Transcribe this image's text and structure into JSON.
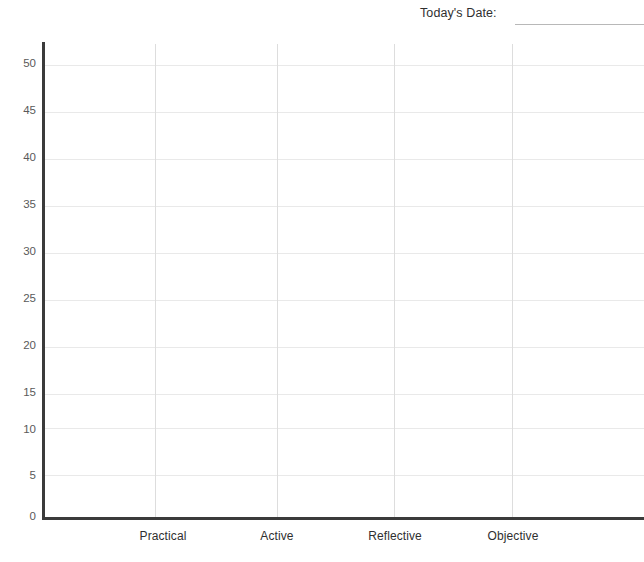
{
  "header": {
    "cut_heading": "",
    "date_label": "Today's Date:",
    "date_value": ""
  },
  "chart_data": {
    "type": "bar",
    "title": "",
    "xlabel": "",
    "ylabel": "",
    "categories": [
      "Practical",
      "Active",
      "Reflective",
      "Objective"
    ],
    "values": [
      null,
      null,
      null,
      null
    ],
    "series": [],
    "ylim": [
      0,
      52
    ],
    "yticks": [
      0,
      5,
      10,
      15,
      20,
      25,
      30,
      35,
      40,
      45,
      50
    ],
    "ytick_labels": [
      "0",
      "5",
      "10",
      "15",
      "20",
      "25",
      "30",
      "35",
      "40",
      "45",
      "50"
    ],
    "grid": {
      "horizontal": true,
      "vertical": true,
      "horizontal_color": "#e9e9e9",
      "vertical_color": "#dddddd"
    },
    "legend": null,
    "legend_position": "none",
    "annotations": [],
    "note": "Blank plotting grid — no data series is drawn."
  },
  "style": {
    "axis_color": "#3b3b3b",
    "tick_label_color": "#5a5a5a",
    "category_label_color": "#2f2f2f",
    "background": "#ffffff",
    "rule_color": "#b8b8b8"
  },
  "geometry": {
    "y_axis_x": 42,
    "x_axis_y": 517,
    "plot_top": 44,
    "plot_right": 644,
    "gridline_x": [
      155,
      277,
      394,
      512
    ],
    "category_label_x": [
      163,
      277,
      395,
      513
    ],
    "ygrid_y": [
      65,
      112,
      159,
      206,
      253,
      300,
      347,
      394,
      428,
      475
    ],
    "ytick_y": [
      63,
      110,
      157,
      204,
      251,
      298,
      345,
      392,
      429,
      475,
      516
    ]
  }
}
